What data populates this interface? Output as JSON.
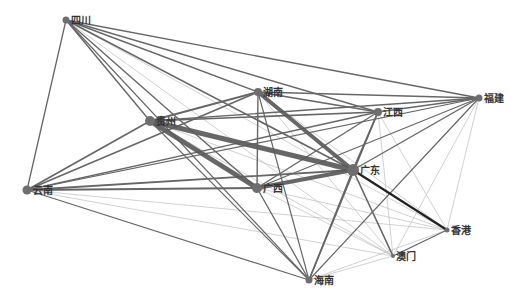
{
  "diagram": {
    "type": "network",
    "colors": {
      "node": "#6e6e6e",
      "label": "#333333",
      "edge_strong": "#5a5a5a",
      "edge_medium": "#666666",
      "edge_weak": "#bdbdbd",
      "edge_darkest": "#222222"
    },
    "nodes": [
      {
        "id": "sichuan",
        "label": "四川",
        "x": 66,
        "y": 20,
        "r": 3.5
      },
      {
        "id": "guizhou",
        "label": "贵州",
        "x": 150,
        "y": 121,
        "r": 5
      },
      {
        "id": "hunan",
        "label": "湖南",
        "x": 258,
        "y": 92,
        "r": 4
      },
      {
        "id": "jiangxi",
        "label": "江西",
        "x": 378,
        "y": 112,
        "r": 4
      },
      {
        "id": "fujian",
        "label": "福建",
        "x": 479,
        "y": 98,
        "r": 3.5
      },
      {
        "id": "guangdong",
        "label": "广东",
        "x": 353,
        "y": 170,
        "r": 6
      },
      {
        "id": "guangxi",
        "label": "广西",
        "x": 257,
        "y": 188,
        "r": 5
      },
      {
        "id": "yunnan",
        "label": "云南",
        "x": 27,
        "y": 190,
        "r": 4.5
      },
      {
        "id": "hongkong",
        "label": "香港",
        "x": 447,
        "y": 230,
        "r": 2.5
      },
      {
        "id": "macau",
        "label": "澳门",
        "x": 393,
        "y": 256,
        "r": 2
      },
      {
        "id": "hainan",
        "label": "海南",
        "x": 309,
        "y": 280,
        "r": 3.5
      }
    ],
    "edges": [
      {
        "s": "guizhou",
        "t": "guangdong",
        "w": 5,
        "c": "edge_strong"
      },
      {
        "s": "guizhou",
        "t": "guangxi",
        "w": 5,
        "c": "edge_strong"
      },
      {
        "s": "hunan",
        "t": "guangdong",
        "w": 4,
        "c": "edge_strong"
      },
      {
        "s": "guangxi",
        "t": "guangdong",
        "w": 4,
        "c": "edge_strong"
      },
      {
        "s": "guangdong",
        "t": "hongkong",
        "w": 2.2,
        "c": "edge_darkest"
      },
      {
        "s": "guizhou",
        "t": "hunan",
        "w": 2,
        "c": "edge_medium"
      },
      {
        "s": "guizhou",
        "t": "jiangxi",
        "w": 1.6,
        "c": "edge_medium"
      },
      {
        "s": "guizhou",
        "t": "fujian",
        "w": 1.4,
        "c": "edge_medium"
      },
      {
        "s": "guizhou",
        "t": "hainan",
        "w": 1.2,
        "c": "edge_medium"
      },
      {
        "s": "guizhou",
        "t": "macau",
        "w": 0.7,
        "c": "edge_weak"
      },
      {
        "s": "guizhou",
        "t": "hongkong",
        "w": 0.7,
        "c": "edge_weak"
      },
      {
        "s": "sichuan",
        "t": "yunnan",
        "w": 1.3,
        "c": "edge_medium"
      },
      {
        "s": "sichuan",
        "t": "guizhou",
        "w": 1.4,
        "c": "edge_medium"
      },
      {
        "s": "sichuan",
        "t": "hunan",
        "w": 1.4,
        "c": "edge_medium"
      },
      {
        "s": "sichuan",
        "t": "jiangxi",
        "w": 1.4,
        "c": "edge_medium"
      },
      {
        "s": "sichuan",
        "t": "fujian",
        "w": 1.4,
        "c": "edge_medium"
      },
      {
        "s": "sichuan",
        "t": "guangdong",
        "w": 1.6,
        "c": "edge_medium"
      },
      {
        "s": "sichuan",
        "t": "guangxi",
        "w": 1.4,
        "c": "edge_medium"
      },
      {
        "s": "sichuan",
        "t": "hainan",
        "w": 1.2,
        "c": "edge_medium"
      },
      {
        "s": "sichuan",
        "t": "hongkong",
        "w": 0.7,
        "c": "edge_weak"
      },
      {
        "s": "sichuan",
        "t": "macau",
        "w": 0.7,
        "c": "edge_weak"
      },
      {
        "s": "yunnan",
        "t": "guizhou",
        "w": 1.6,
        "c": "edge_medium"
      },
      {
        "s": "yunnan",
        "t": "hunan",
        "w": 1.6,
        "c": "edge_medium"
      },
      {
        "s": "yunnan",
        "t": "jiangxi",
        "w": 1.4,
        "c": "edge_medium"
      },
      {
        "s": "yunnan",
        "t": "guangdong",
        "w": 1.8,
        "c": "edge_medium"
      },
      {
        "s": "yunnan",
        "t": "guangxi",
        "w": 1.8,
        "c": "edge_medium"
      },
      {
        "s": "yunnan",
        "t": "fujian",
        "w": 1.2,
        "c": "edge_medium"
      },
      {
        "s": "yunnan",
        "t": "hainan",
        "w": 1.2,
        "c": "edge_medium"
      },
      {
        "s": "yunnan",
        "t": "hongkong",
        "w": 0.7,
        "c": "edge_weak"
      },
      {
        "s": "yunnan",
        "t": "macau",
        "w": 0.7,
        "c": "edge_weak"
      },
      {
        "s": "hunan",
        "t": "jiangxi",
        "w": 1.6,
        "c": "edge_medium"
      },
      {
        "s": "hunan",
        "t": "fujian",
        "w": 1.4,
        "c": "edge_medium"
      },
      {
        "s": "hunan",
        "t": "guangxi",
        "w": 1.4,
        "c": "edge_medium"
      },
      {
        "s": "hunan",
        "t": "hainan",
        "w": 1.2,
        "c": "edge_medium"
      },
      {
        "s": "hunan",
        "t": "hongkong",
        "w": 0.7,
        "c": "edge_weak"
      },
      {
        "s": "hunan",
        "t": "macau",
        "w": 0.7,
        "c": "edge_weak"
      },
      {
        "s": "jiangxi",
        "t": "fujian",
        "w": 1.4,
        "c": "edge_medium"
      },
      {
        "s": "jiangxi",
        "t": "guangdong",
        "w": 1.8,
        "c": "edge_medium"
      },
      {
        "s": "jiangxi",
        "t": "guangxi",
        "w": 1.4,
        "c": "edge_medium"
      },
      {
        "s": "jiangxi",
        "t": "hainan",
        "w": 1.4,
        "c": "edge_medium"
      },
      {
        "s": "jiangxi",
        "t": "hongkong",
        "w": 0.7,
        "c": "edge_weak"
      },
      {
        "s": "jiangxi",
        "t": "macau",
        "w": 0.7,
        "c": "edge_weak"
      },
      {
        "s": "fujian",
        "t": "guangdong",
        "w": 1.4,
        "c": "edge_medium"
      },
      {
        "s": "fujian",
        "t": "guangxi",
        "w": 1.2,
        "c": "edge_medium"
      },
      {
        "s": "fujian",
        "t": "hainan",
        "w": 1.2,
        "c": "edge_medium"
      },
      {
        "s": "fujian",
        "t": "hongkong",
        "w": 0.7,
        "c": "edge_weak"
      },
      {
        "s": "fujian",
        "t": "macau",
        "w": 0.7,
        "c": "edge_weak"
      },
      {
        "s": "guangdong",
        "t": "macau",
        "w": 1.6,
        "c": "edge_medium"
      },
      {
        "s": "guangdong",
        "t": "hainan",
        "w": 1.6,
        "c": "edge_medium"
      },
      {
        "s": "guangxi",
        "t": "hainan",
        "w": 1.3,
        "c": "edge_medium"
      },
      {
        "s": "guangxi",
        "t": "hongkong",
        "w": 0.7,
        "c": "edge_weak"
      },
      {
        "s": "guangxi",
        "t": "macau",
        "w": 0.7,
        "c": "edge_weak"
      },
      {
        "s": "hongkong",
        "t": "macau",
        "w": 1.2,
        "c": "edge_medium"
      },
      {
        "s": "hongkong",
        "t": "hainan",
        "w": 0.7,
        "c": "edge_weak"
      },
      {
        "s": "macau",
        "t": "hainan",
        "w": 0.7,
        "c": "edge_weak"
      }
    ]
  }
}
